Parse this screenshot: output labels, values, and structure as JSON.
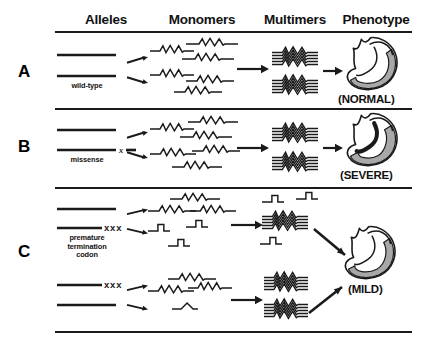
{
  "figure": {
    "headers": [
      {
        "label": "Alleles",
        "x": 60,
        "w": 92
      },
      {
        "label": "Monomers",
        "x": 148,
        "w": 108
      },
      {
        "label": "Multimers",
        "x": 248,
        "w": 94
      },
      {
        "label": "Phenotype",
        "x": 332,
        "w": 88
      }
    ],
    "header_y": 12,
    "rules": [
      {
        "x": 55,
        "y": 31,
        "w": 357,
        "thin": false
      },
      {
        "x": 55,
        "y": 108,
        "w": 357,
        "thin": false
      },
      {
        "x": 55,
        "y": 187,
        "w": 357,
        "thin": false
      },
      {
        "x": 55,
        "y": 331,
        "w": 357,
        "thin": false
      }
    ],
    "panels": [
      {
        "letter": "A",
        "letter_x": 18,
        "letter_y": 62,
        "alleles": [
          {
            "x": 56,
            "y": 55,
            "w": 60,
            "marker": "none",
            "marker_text": ""
          },
          {
            "x": 56,
            "y": 76,
            "w": 60,
            "marker": "none",
            "marker_text": ""
          }
        ],
        "allele_caption": "wild-type",
        "caption_x": 56,
        "caption_y": 82,
        "caption_w": 62,
        "split_arrows": [
          {
            "x": 126,
            "y": 60,
            "dy": -5
          },
          {
            "x": 126,
            "y": 80,
            "dy": 5
          }
        ],
        "monomers": [
          {
            "type": "full",
            "x": 150,
            "y": 52,
            "w": 44
          },
          {
            "type": "full",
            "x": 186,
            "y": 45,
            "w": 52
          },
          {
            "type": "full",
            "x": 182,
            "y": 60,
            "w": 52
          },
          {
            "type": "full",
            "x": 150,
            "y": 76,
            "w": 44
          },
          {
            "type": "full",
            "x": 186,
            "y": 82,
            "w": 48
          },
          {
            "type": "full",
            "x": 174,
            "y": 93,
            "w": 48
          }
        ],
        "assembly_arrow": {
          "x": 236,
          "y": 69,
          "w": 30
        },
        "multimers": [
          {
            "type": "full",
            "x": 272,
            "y": 58,
            "w": 46,
            "lines": 5
          },
          {
            "type": "full",
            "x": 272,
            "y": 86,
            "w": 46,
            "lines": 5
          }
        ],
        "pheno_arrows": [
          {
            "type": "straight",
            "x": 322,
            "y": 71,
            "w": 18
          }
        ],
        "hearts": [
          {
            "variant": "normal",
            "x": 344,
            "y": 36,
            "w": 58,
            "h": 56
          }
        ],
        "pheno_caption": "(NORMAL)",
        "pheno_x": 338,
        "pheno_y": 93
      },
      {
        "letter": "B",
        "letter_x": 18,
        "letter_y": 137,
        "alleles": [
          {
            "x": 56,
            "y": 130,
            "w": 60,
            "marker": "none",
            "marker_text": ""
          },
          {
            "x": 56,
            "y": 150,
            "w": 60,
            "marker": "single",
            "marker_text": "x"
          }
        ],
        "allele_caption": "missense",
        "caption_x": 56,
        "caption_y": 156,
        "caption_w": 62,
        "split_arrows": [
          {
            "x": 126,
            "y": 135,
            "dy": -5
          },
          {
            "x": 126,
            "y": 155,
            "dy": 5
          }
        ],
        "monomers": [
          {
            "type": "full",
            "x": 150,
            "y": 130,
            "w": 44
          },
          {
            "type": "full",
            "x": 188,
            "y": 123,
            "w": 50
          },
          {
            "type": "full",
            "x": 180,
            "y": 138,
            "w": 52
          },
          {
            "type": "full",
            "x": 150,
            "y": 155,
            "w": 46
          },
          {
            "type": "full",
            "x": 192,
            "y": 152,
            "w": 48
          },
          {
            "type": "full",
            "x": 172,
            "y": 168,
            "w": 50
          }
        ],
        "assembly_arrow": {
          "x": 236,
          "y": 148,
          "w": 30
        },
        "multimers": [
          {
            "type": "full",
            "x": 272,
            "y": 134,
            "w": 46,
            "lines": 5
          },
          {
            "type": "full",
            "x": 272,
            "y": 163,
            "w": 46,
            "lines": 5
          }
        ],
        "pheno_arrows": [
          {
            "type": "straight",
            "x": 322,
            "y": 148,
            "w": 18
          }
        ],
        "hearts": [
          {
            "variant": "severe",
            "x": 344,
            "y": 112,
            "w": 58,
            "h": 56
          }
        ],
        "pheno_caption": "(SEVERE)",
        "pheno_x": 340,
        "pheno_y": 169
      },
      {
        "letter": "C",
        "letter_x": 18,
        "letter_y": 242,
        "alleles": [
          {
            "x": 56,
            "y": 209,
            "w": 60,
            "marker": "none",
            "marker_text": ""
          },
          {
            "x": 56,
            "y": 228,
            "w": 46,
            "marker": "triple",
            "marker_text": "xxx"
          },
          {
            "x": 56,
            "y": 285,
            "w": 46,
            "marker": "triple",
            "marker_text": "xxx"
          },
          {
            "x": 56,
            "y": 305,
            "w": 60,
            "marker": "none",
            "marker_text": ""
          }
        ],
        "allele_caption": "premature\ntermination\ncodon",
        "caption_x": 50,
        "caption_y": 234,
        "caption_w": 74,
        "split_arrows": [
          {
            "x": 126,
            "y": 212,
            "dy": -4
          },
          {
            "x": 126,
            "y": 231,
            "dy": 4
          },
          {
            "x": 126,
            "y": 288,
            "dy": -4
          },
          {
            "x": 126,
            "y": 307,
            "dy": 4
          }
        ],
        "monomers": [
          {
            "type": "full",
            "x": 170,
            "y": 200,
            "w": 50
          },
          {
            "type": "full",
            "x": 148,
            "y": 212,
            "w": 48
          },
          {
            "type": "full",
            "x": 190,
            "y": 212,
            "w": 46
          },
          {
            "type": "trunc",
            "x": 148,
            "y": 230,
            "w": 22
          },
          {
            "type": "trunc",
            "x": 186,
            "y": 226,
            "w": 22
          },
          {
            "type": "trunc",
            "x": 168,
            "y": 245,
            "w": 22
          },
          {
            "type": "full",
            "x": 168,
            "y": 280,
            "w": 48
          },
          {
            "type": "full",
            "x": 148,
            "y": 292,
            "w": 46
          },
          {
            "type": "full",
            "x": 188,
            "y": 289,
            "w": 44
          },
          {
            "type": "bump",
            "x": 172,
            "y": 310,
            "w": 26
          }
        ],
        "assembly_arrow": {
          "x": 230,
          "y": 225,
          "w": 30
        },
        "assembly_arrow2": {
          "x": 230,
          "y": 300,
          "w": 30
        },
        "multimers": [
          {
            "type": "trunc",
            "x": 262,
            "y": 201,
            "w": 22
          },
          {
            "type": "trunc",
            "x": 296,
            "y": 198,
            "w": 22
          },
          {
            "type": "full",
            "x": 262,
            "y": 222,
            "w": 46,
            "lines": 5
          },
          {
            "type": "trunc",
            "x": 260,
            "y": 243,
            "w": 22
          },
          {
            "type": "full",
            "x": 264,
            "y": 283,
            "w": 44,
            "lines": 5
          },
          {
            "type": "full",
            "x": 264,
            "y": 310,
            "w": 44,
            "lines": 5
          }
        ],
        "pheno_arrows": [
          {
            "type": "diag-down",
            "x": 313,
            "y": 228,
            "w": 28,
            "h": 22
          },
          {
            "type": "diag-up",
            "x": 308,
            "y": 286,
            "w": 30,
            "h": 22
          }
        ],
        "hearts": [
          {
            "variant": "mild",
            "x": 342,
            "y": 225,
            "w": 58,
            "h": 56
          }
        ],
        "pheno_caption": "(MILD)",
        "pheno_x": 348,
        "pheno_y": 283
      }
    ]
  },
  "colors": {
    "ink": "#1a1a1a",
    "heart_fill": "#a8a8a8",
    "heart_fill_light": "#bdbdbd",
    "background": "#ffffff"
  }
}
